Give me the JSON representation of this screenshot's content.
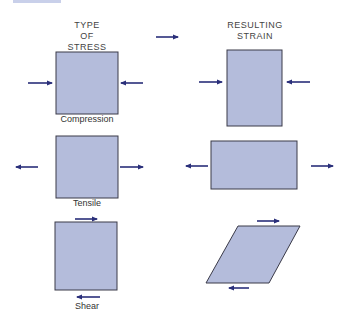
{
  "headings": {
    "stress": [
      "TYPE",
      "OF",
      "STRESS"
    ],
    "strain": [
      "RESULTING",
      "STRAIN"
    ]
  },
  "stress_types": [
    {
      "label": "Compression"
    },
    {
      "label": "Tensile"
    },
    {
      "label": "Shear"
    }
  ],
  "colors": {
    "fill": "#b4bcdb",
    "stroke": "#3a3a48",
    "arrow": "#2a2f7a",
    "topbar": "#c9d0ea"
  }
}
